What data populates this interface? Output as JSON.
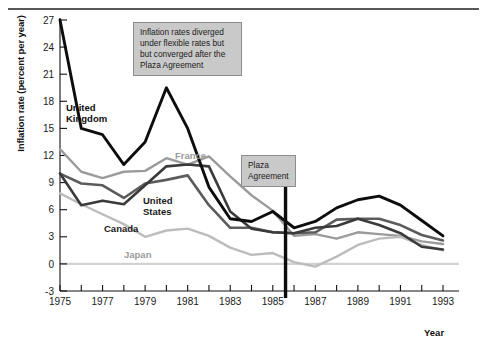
{
  "chart_data": {
    "type": "line",
    "title": "",
    "xlabel": "Year",
    "ylabel": "Inflation rate (percent per year)",
    "xlim": [
      1975,
      1993
    ],
    "ylim": [
      -3,
      27
    ],
    "yticks": [
      -3,
      0,
      3,
      6,
      9,
      12,
      15,
      18,
      21,
      24,
      27
    ],
    "ytick_labels": [
      "-3",
      "0",
      "3",
      "6",
      "9",
      "12",
      "15",
      "18",
      "21",
      "24",
      "27"
    ],
    "xticks": [
      1975,
      1976,
      1977,
      1978,
      1979,
      1980,
      1981,
      1982,
      1983,
      1984,
      1985,
      1986,
      1987,
      1988,
      1989,
      1990,
      1991,
      1992,
      1993
    ],
    "xtick_labels": [
      "1975",
      "",
      "1977",
      "",
      "1979",
      "",
      "1981",
      "",
      "1983",
      "",
      "1985",
      "",
      "1987",
      "",
      "1989",
      "",
      "1991",
      "",
      "1993"
    ],
    "grid": false,
    "zero_line": true,
    "legend": "inline-labels",
    "x": [
      1975,
      1976,
      1977,
      1978,
      1979,
      1980,
      1981,
      1982,
      1983,
      1984,
      1985,
      1986,
      1987,
      1988,
      1989,
      1990,
      1991,
      1992,
      1993
    ],
    "series": [
      {
        "name": "United Kingdom",
        "color": "#0d0d0d",
        "width": 2.9,
        "values": [
          27.0,
          15.0,
          14.3,
          11.0,
          13.5,
          19.5,
          15.0,
          8.5,
          5.0,
          4.7,
          5.8,
          4.0,
          4.7,
          6.2,
          7.1,
          7.5,
          6.5,
          4.8,
          3.1
        ]
      },
      {
        "name": "France",
        "color": "#9b9b9b",
        "width": 2.4,
        "values": [
          12.7,
          10.2,
          9.5,
          10.2,
          10.3,
          11.7,
          11.0,
          11.9,
          9.7,
          7.6,
          5.9,
          3.1,
          3.3,
          2.8,
          3.5,
          3.3,
          3.1,
          2.5,
          2.2
        ]
      },
      {
        "name": "United States",
        "color": "#5c5c5c",
        "width": 2.6,
        "values": [
          10.0,
          8.9,
          8.7,
          7.3,
          8.9,
          9.3,
          9.8,
          6.5,
          4.0,
          4.0,
          3.5,
          3.4,
          3.5,
          4.9,
          5.0,
          5.0,
          4.3,
          3.2,
          2.6
        ]
      },
      {
        "name": "Canada",
        "color": "#3a3a3a",
        "width": 2.6,
        "values": [
          10.0,
          6.5,
          7.0,
          6.6,
          8.7,
          10.8,
          11.0,
          10.8,
          5.8,
          3.9,
          3.5,
          3.4,
          4.0,
          4.2,
          5.0,
          4.3,
          3.4,
          1.9,
          1.6
        ]
      },
      {
        "name": "Japan",
        "color": "#bcbcbc",
        "width": 2.4,
        "values": [
          7.8,
          6.6,
          5.5,
          4.4,
          3.0,
          3.7,
          3.9,
          3.1,
          1.8,
          1.0,
          1.2,
          0.2,
          -0.3,
          0.8,
          2.1,
          2.8,
          3.0,
          2.1,
          1.5
        ]
      }
    ],
    "series_labels": [
      {
        "name": "United Kingdom",
        "text": "United\nKingdom",
        "color": "#0d0d0d"
      },
      {
        "name": "France",
        "text": "France",
        "color": "#9b9b9b"
      },
      {
        "name": "United States",
        "text": "United\nStates",
        "color": "#1a1a1a"
      },
      {
        "name": "Canada",
        "text": "Canada",
        "color": "#1a1a1a"
      },
      {
        "name": "Japan",
        "text": "Japan",
        "color": "#9b9b9b"
      }
    ],
    "annotations": [
      {
        "id": "annotation-callout",
        "text": "Inflation rates diverged under flexible rates but but converged after the Plaza Agreement"
      },
      {
        "id": "plaza-callout",
        "text": "Plaza\nAgreement",
        "marker_year": 1985.6
      }
    ]
  },
  "axes": {
    "ylabel": "Inflation rate (percent per year)",
    "xlabel": "Year"
  }
}
